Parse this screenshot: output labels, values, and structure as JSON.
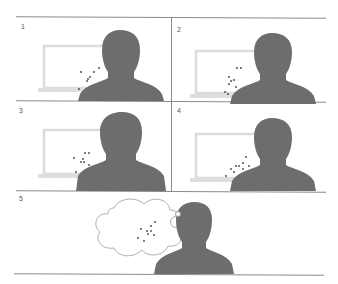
{
  "colors": {
    "silhouette": "#6d6d6d",
    "laptop": "#dcdcdc",
    "points": "#444444",
    "divider": "#8a8a8a",
    "cloud_stroke": "#9a9a9a"
  },
  "panels": [
    {
      "label": "1",
      "points": [
        [
          18,
          14
        ],
        [
          31,
          14
        ],
        [
          36,
          10
        ],
        [
          25,
          21
        ],
        [
          27,
          19
        ],
        [
          24,
          23
        ],
        [
          16,
          31
        ],
        [
          23,
          31
        ],
        [
          30,
          31
        ]
      ]
    },
    {
      "label": "2",
      "points": [
        [
          28,
          8
        ],
        [
          32,
          8
        ],
        [
          20,
          17
        ],
        [
          22,
          21
        ],
        [
          25,
          20
        ],
        [
          20,
          24
        ],
        [
          27,
          27
        ],
        [
          16,
          32
        ],
        [
          19,
          34
        ]
      ]
    },
    {
      "label": "3",
      "points": [
        [
          35,
          10
        ],
        [
          39,
          10
        ],
        [
          24,
          15
        ],
        [
          33,
          16
        ],
        [
          31,
          19
        ],
        [
          34,
          19
        ],
        [
          39,
          22
        ],
        [
          26,
          29
        ],
        [
          35,
          32
        ]
      ]
    },
    {
      "label": "4",
      "points": [
        [
          36,
          12
        ],
        [
          33,
          18
        ],
        [
          26,
          21
        ],
        [
          29,
          21
        ],
        [
          39,
          21
        ],
        [
          21,
          24
        ],
        [
          33,
          24
        ],
        [
          24,
          27
        ],
        [
          16,
          31
        ]
      ]
    },
    {
      "label": "5",
      "points": [
        [
          34,
          9
        ],
        [
          30,
          13
        ],
        [
          20,
          16
        ],
        [
          26,
          18
        ],
        [
          30,
          18
        ],
        [
          27,
          21
        ],
        [
          33,
          22
        ],
        [
          17,
          25
        ],
        [
          23,
          28
        ]
      ]
    }
  ],
  "icons": [
    "person-silhouette-icon",
    "laptop-icon",
    "thought-cloud-icon"
  ]
}
